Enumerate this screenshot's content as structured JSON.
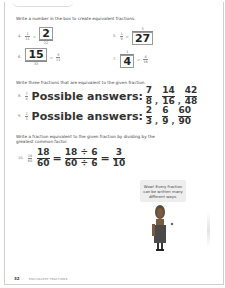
{
  "worksheet": {
    "section1": {
      "instruction": "Write a number in the box to create equivalent fractions.",
      "questions": [
        {
          "number": "4.",
          "left_num": "1",
          "left_den": "11",
          "right_num_box": "2",
          "right_den": "22"
        },
        {
          "number": "5.",
          "left_num": "1",
          "left_den": "9",
          "right_num": "3",
          "right_den_box": "27"
        },
        {
          "number": "6.",
          "left_num_box": "15",
          "left_den": "33",
          "right_num": "5",
          "right_den": "11"
        },
        {
          "number": "7.",
          "left_num": "1",
          "left_den_box": "4",
          "right_num": "4",
          "right_den": "16"
        }
      ]
    },
    "section2": {
      "instruction": "Write three fractions that are equivalent to the given fraction.",
      "questions": [
        {
          "number": "8.",
          "given_num": "7",
          "given_den": "8",
          "label": "Possible answers:",
          "answers": [
            {
              "num": "7",
              "den": "8"
            },
            {
              "num": "14",
              "den": "16"
            },
            {
              "num": "42",
              "den": "48"
            }
          ]
        },
        {
          "number": "9.",
          "given_num": "2",
          "given_den": "3",
          "label": "Possible answers:",
          "answers": [
            {
              "num": "2",
              "den": "3"
            },
            {
              "num": "6",
              "den": "9"
            },
            {
              "num": "60",
              "den": "90"
            }
          ]
        }
      ]
    },
    "section3": {
      "instruction": "Write a fraction equivalent to the given fraction by dividing by the greatest common factor.",
      "question": {
        "number": "10.",
        "given_num": "18",
        "given_den": "60",
        "step1_num": "18",
        "step1_den": "60",
        "step2_num": "18 ÷ 6",
        "step2_den": "60 ÷ 6",
        "result_num": "3",
        "result_den": "10",
        "equals": "="
      }
    },
    "speech_bubble": "Wow! Every fraction can be written many different ways.",
    "footer": {
      "page_number": "32",
      "title": "EQUIVALENT FRACTIONS"
    },
    "illustration": "character-icon"
  }
}
